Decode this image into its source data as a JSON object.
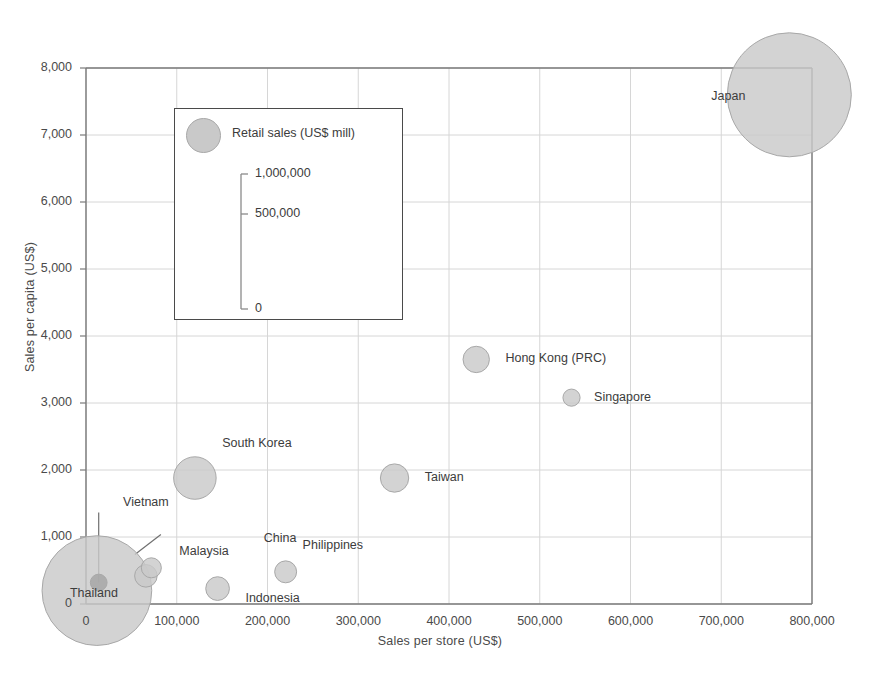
{
  "chart_data": {
    "type": "scatter",
    "title": "",
    "xlabel": "Sales per store (US$)",
    "ylabel": "Sales per capita (US$)",
    "xlim": [
      0,
      800000
    ],
    "ylim": [
      0,
      8000
    ],
    "xticks": [
      "0",
      "100,000",
      "200,000",
      "300,000",
      "400,000",
      "500,000",
      "600,000",
      "700,000",
      "800,000"
    ],
    "xtick_values": [
      0,
      100000,
      200000,
      300000,
      400000,
      500000,
      600000,
      700000,
      800000
    ],
    "yticks": [
      "0",
      "1,000",
      "2,000",
      "3,000",
      "4,000",
      "5,000",
      "6,000",
      "7,000",
      "8,000"
    ],
    "ytick_values": [
      0,
      1000,
      2000,
      3000,
      4000,
      5000,
      6000,
      7000,
      8000
    ],
    "grid": true,
    "bubble_size_label": "Retail sales (US$ mill)",
    "legend_position": "inside-upper-left",
    "series": [
      {
        "name": "Retail sales (US$ mill)",
        "points": [
          {
            "label": "Japan",
            "x": 775000,
            "y": 7600,
            "size": 1150000,
            "label_dx": -78,
            "label_dy": 2
          },
          {
            "label": "Hong Kong (PRC)",
            "x": 430000,
            "y": 3650,
            "size": 52000,
            "label_dx": 16,
            "label_dy": 0
          },
          {
            "label": "Singapore",
            "x": 535000,
            "y": 3080,
            "size": 22000,
            "label_dx": 14,
            "label_dy": 0
          },
          {
            "label": "South Korea",
            "x": 120000,
            "y": 1880,
            "size": 135000,
            "label_dx": 6,
            "label_dy": -34
          },
          {
            "label": "Taiwan",
            "x": 340000,
            "y": 1880,
            "size": 60000,
            "label_dx": 16,
            "label_dy": 0
          },
          {
            "label": "Philippines",
            "x": 220000,
            "y": 480,
            "size": 36000,
            "label_dx": 6,
            "label_dy": -26
          },
          {
            "label": "Malaysia",
            "x": 72000,
            "y": 540,
            "size": 30000,
            "label_dx": 18,
            "label_dy": -16
          },
          {
            "label": "Thailand",
            "x": 66000,
            "y": 420,
            "size": 38000,
            "label_dx": -76,
            "label_dy": 18
          },
          {
            "label": "Indonesia",
            "x": 145000,
            "y": 230,
            "size": 42000,
            "label_dx": 16,
            "label_dy": 10
          },
          {
            "label": "China",
            "x": 12000,
            "y": 200,
            "size": 900000,
            "label_dx": 112,
            "label_dy": -52
          },
          {
            "label": "Vietnam",
            "x": 14000,
            "y": 320,
            "size": 21000,
            "label_dx": 16,
            "label_dy": -80
          }
        ]
      }
    ],
    "legend_scale": {
      "title": "Retail sales (US$ mill)",
      "ticks": [
        "1,000,000",
        "500,000",
        "0"
      ],
      "tick_values": [
        1000000,
        500000,
        0
      ]
    }
  },
  "colors": {
    "bubble_fill": "#c9c9c9",
    "bubble_stroke": "#a8a8a8",
    "vietnam_fill": "#a5a5a5",
    "grid": "#d6d6d6",
    "axis": "#7a7a7a",
    "text": "#3c3c3c"
  }
}
